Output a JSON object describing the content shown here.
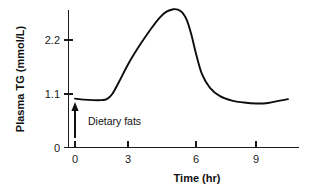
{
  "chart_data": {
    "type": "line",
    "title": "",
    "subtitle": "",
    "xlabel": "Time (hr)",
    "ylabel": "Plasma TG (mmol/L)",
    "xlim": [
      0,
      10.6
    ],
    "ylim": [
      0,
      2.95
    ],
    "grid": false,
    "legend": null,
    "x_ticks": [
      "0",
      "3",
      "6",
      "9"
    ],
    "x_tick_values": [
      0,
      3,
      6,
      9
    ],
    "y_ticks": [
      "0",
      "1.1",
      "2.2"
    ],
    "y_tick_values": [
      0,
      1.1,
      2.2
    ],
    "series": [
      {
        "name": "Plasma TG",
        "color": "#0d0d0d",
        "x": [
          0.0,
          0.5,
          1.0,
          1.5,
          1.8,
          2.1,
          2.5,
          3.0,
          3.5,
          4.0,
          4.4,
          4.7,
          5.0,
          5.2,
          5.4,
          5.6,
          5.8,
          6.0,
          6.3,
          6.7,
          7.2,
          7.8,
          8.4,
          9.0,
          9.6,
          10.2,
          10.6
        ],
        "y": [
          1.0,
          0.98,
          0.97,
          0.97,
          0.99,
          1.09,
          1.35,
          1.7,
          2.08,
          2.42,
          2.66,
          2.78,
          2.83,
          2.82,
          2.76,
          2.6,
          2.3,
          1.92,
          1.5,
          1.22,
          1.05,
          0.96,
          0.92,
          0.9,
          0.91,
          0.96,
          0.99
        ]
      }
    ],
    "annotations": [
      {
        "label": "Dietary fats",
        "x": 0,
        "y_from": 0.2,
        "y_to": 0.93,
        "marker": "up-arrow"
      }
    ]
  },
  "axis_style": {
    "line_color": "#1a1a1a",
    "text_color": "#111111",
    "background": "#ffffff"
  }
}
